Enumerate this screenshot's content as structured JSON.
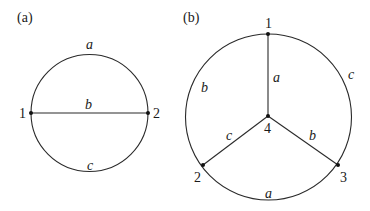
{
  "panels": [
    {
      "id": "a",
      "caption": "(a)",
      "nodes": [
        {
          "id": "1",
          "label": "1"
        },
        {
          "id": "2",
          "label": "2"
        }
      ],
      "edges": [
        {
          "label": "a",
          "desc": "upper arc between 1 and 2"
        },
        {
          "label": "b",
          "desc": "straight chord between 1 and 2"
        },
        {
          "label": "c",
          "desc": "lower arc between 1 and 2"
        }
      ]
    },
    {
      "id": "b",
      "caption": "(b)",
      "nodes": [
        {
          "id": "1",
          "label": "1"
        },
        {
          "id": "2",
          "label": "2"
        },
        {
          "id": "3",
          "label": "3"
        },
        {
          "id": "4",
          "label": "4"
        }
      ],
      "edges": [
        {
          "label": "a",
          "desc": "spoke 1-4"
        },
        {
          "label": "c",
          "desc": "spoke 4-2"
        },
        {
          "label": "b",
          "desc": "spoke 4-3"
        },
        {
          "label": "b",
          "desc": "arc 1-2 (left)"
        },
        {
          "label": "c",
          "desc": "arc 1-3 (right)"
        },
        {
          "label": "a",
          "desc": "arc 2-3 (bottom)"
        }
      ]
    }
  ]
}
